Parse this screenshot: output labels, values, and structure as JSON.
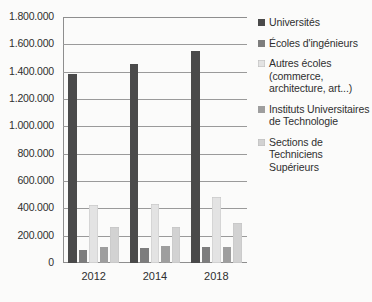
{
  "chart_data": {
    "type": "bar",
    "title": "",
    "subtitle": "",
    "xlabel": "",
    "ylabel": "",
    "categories": [
      "2012",
      "2014",
      "2018"
    ],
    "ylim": [
      0,
      1800000
    ],
    "ytick_labels": [
      "1.800.000",
      "1.600.000",
      "1.400.000",
      "1.200.000",
      "1.000.000",
      "800.000",
      "600.000",
      "400.000",
      "200.000",
      "0"
    ],
    "ytick_values": [
      1800000,
      1600000,
      1400000,
      1200000,
      1000000,
      800000,
      600000,
      400000,
      200000,
      0
    ],
    "grid": true,
    "legend_position": "right",
    "series": [
      {
        "name": "Universités",
        "color": "#4a4a4a",
        "values": [
          1380000,
          1455000,
          1550000
        ]
      },
      {
        "name": "Écoles d'ingénieurs",
        "color": "#7d7d7d",
        "values": [
          95000,
          110000,
          120000
        ]
      },
      {
        "name": "Autres écoles (commerce, architecture, art...)",
        "color": "#e3e3e3",
        "values": [
          425000,
          430000,
          485000
        ]
      },
      {
        "name": "Instituts Universitaires de Technologie",
        "color": "#9e9e9e",
        "values": [
          118000,
          125000,
          120000
        ]
      },
      {
        "name": "Sections de Techniciens Supérieurs",
        "color": "#d2d2d2",
        "values": [
          265000,
          265000,
          290000
        ]
      }
    ],
    "legend": [
      {
        "label": "Universités",
        "color": "#4a4a4a"
      },
      {
        "label": "Écoles d'ingénieurs",
        "color": "#7d7d7d"
      },
      {
        "label": "Autres écoles (commerce, architecture, art...)",
        "color": "#e3e3e3"
      },
      {
        "label": "Instituts Universitaires de Technologie",
        "color": "#9e9e9e"
      },
      {
        "label": "Sections de Techniciens Supérieurs",
        "color": "#d2d2d2"
      }
    ]
  }
}
